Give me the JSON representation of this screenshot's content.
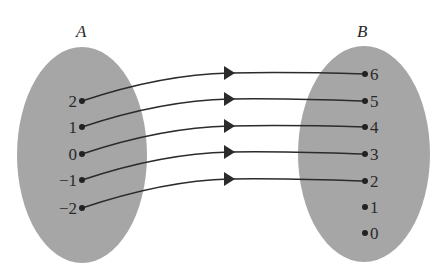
{
  "diagram": {
    "type": "function-mapping",
    "colors": {
      "set_fill": "#a6a6a6",
      "line": "#2b2b2b",
      "background": "#ffffff"
    },
    "sets": [
      {
        "name": "A",
        "elements": [
          "2",
          "1",
          "0",
          "−1",
          "−2"
        ]
      },
      {
        "name": "B",
        "elements": [
          "6",
          "5",
          "4",
          "3",
          "2",
          "1",
          "0"
        ]
      }
    ],
    "mappings": [
      {
        "from": "2",
        "to": "6"
      },
      {
        "from": "1",
        "to": "5"
      },
      {
        "from": "0",
        "to": "4"
      },
      {
        "from": "−1",
        "to": "3"
      },
      {
        "from": "−2",
        "to": "2"
      }
    ]
  }
}
